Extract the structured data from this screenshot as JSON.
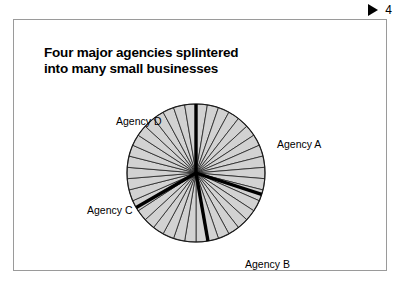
{
  "page_marker": {
    "icon": "play-triangle-icon",
    "number": "4"
  },
  "slide": {
    "title": "Four major agencies splintered\ninto many small businesses"
  },
  "labels": {
    "agency_a": "Agency A",
    "agency_b": "Agency B",
    "agency_c": "Agency C",
    "agency_d": "Agency D"
  },
  "colors": {
    "slice_fill": "#d2d2d2",
    "slice_stroke": "#1a1a1a",
    "major_divider": "#000000",
    "frame_border": "#9a9a9a",
    "text": "#000000",
    "background": "#ffffff"
  },
  "chart_data": {
    "type": "pie",
    "title": "Four major agencies splintered into many small businesses",
    "subtitle": "",
    "xlabel": "",
    "ylabel": "",
    "legend_position": "around-pie",
    "grid": false,
    "note": "Pie of many equal thin slices representing small businesses; four thick radial dividers mark the former boundaries of the four major agencies.",
    "center": {
      "x": 195,
      "y": 172
    },
    "radius": 69,
    "small_slice_count": 38,
    "small_slice_share_pct": 2.63,
    "categories": [
      "Agency A",
      "Agency B",
      "Agency C",
      "Agency D"
    ],
    "values": [
      30.0,
      23.3,
      25.0,
      21.7
    ],
    "major_dividers_deg": [
      0,
      108,
      170,
      240
    ],
    "divider_labels": [
      "Agency A",
      "Agency B",
      "Agency C",
      "Agency D"
    ],
    "segments": [
      {
        "name": "Agency A",
        "start_deg": 0,
        "end_deg": 108,
        "share_pct": 30.0,
        "label_position": "right"
      },
      {
        "name": "Agency B",
        "start_deg": 108,
        "end_deg": 192,
        "share_pct": 23.3,
        "label_position": "bottom-right"
      },
      {
        "name": "Agency C",
        "start_deg": 192,
        "end_deg": 282,
        "share_pct": 25.0,
        "label_position": "left"
      },
      {
        "name": "Agency D",
        "start_deg": 282,
        "end_deg": 360,
        "share_pct": 21.7,
        "label_position": "upper-left"
      }
    ]
  }
}
